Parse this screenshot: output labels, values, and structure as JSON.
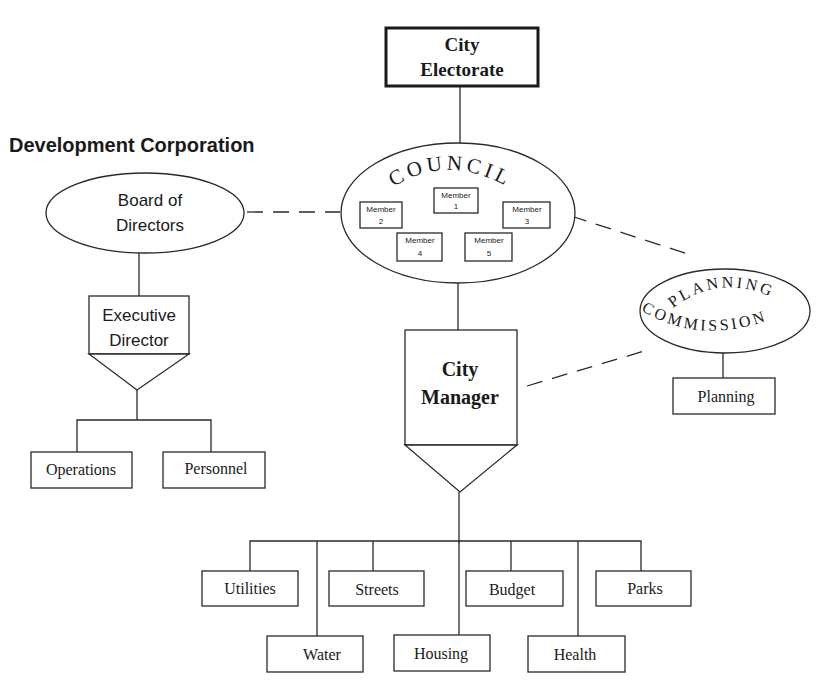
{
  "title": "Development Corporation",
  "nodes": {
    "electorate": {
      "line1": "City",
      "line2": "Electorate"
    },
    "council": {
      "label": "COUNCIL",
      "members": [
        {
          "label": "Member",
          "num": "1"
        },
        {
          "label": "Member",
          "num": "2"
        },
        {
          "label": "Member",
          "num": "3"
        },
        {
          "label": "Member",
          "num": "4"
        },
        {
          "label": "Member",
          "num": "5"
        }
      ]
    },
    "board": {
      "line1": "Board of",
      "line2": "Directors"
    },
    "executive": {
      "line1": "Executive",
      "line2": "Director"
    },
    "operations": "Operations",
    "personnel": "Personnel",
    "planning_commission": {
      "line1": "PLANNING",
      "line2": "COMMISSION"
    },
    "planning": "Planning",
    "manager": {
      "line1": "City",
      "line2": "Manager"
    },
    "departments_top": [
      "Utilities",
      "Streets",
      "Budget",
      "Parks"
    ],
    "departments_bottom": [
      "Water",
      "Housing",
      "Health"
    ]
  },
  "colors": {
    "line": "#2a2a2a",
    "text": "#1a1a1a",
    "background": "#ffffff"
  }
}
